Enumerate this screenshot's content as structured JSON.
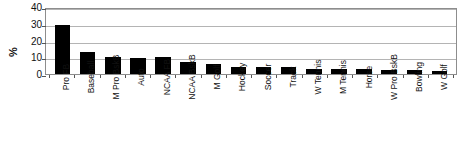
{
  "chart_data": {
    "type": "bar",
    "title": "",
    "xlabel": "",
    "ylabel": "%",
    "ylim": [
      0,
      40
    ],
    "yticks": [
      0,
      10,
      20,
      30,
      40
    ],
    "grid": true,
    "legend": "none",
    "orientation": "vertical",
    "bar_color": "#000000",
    "categories": [
      "Pro FB",
      "Baseball",
      "M Pro BskB",
      "Auto",
      "NCAA FB",
      "NCAA BskB",
      "M Golf",
      "Hockey",
      "Soccer",
      "Track",
      "W Tennis",
      "M Tennis",
      "Horse",
      "W Pro BskB",
      "Bowling",
      "W Golf"
    ],
    "values": [
      29,
      13,
      10,
      9.5,
      10,
      7,
      6,
      4,
      4,
      4,
      3,
      3,
      3,
      2.5,
      2.5,
      2
    ]
  },
  "axis": {
    "y_title": "%",
    "tick_labels": [
      "40",
      "30",
      "20",
      "10",
      "0"
    ]
  }
}
